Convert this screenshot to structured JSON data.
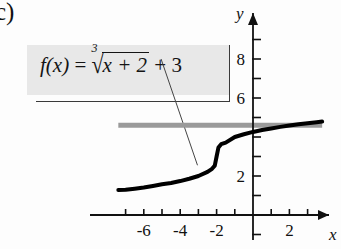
{
  "figure": {
    "part_label": "c)",
    "background_color": "#fdfdfd"
  },
  "callout": {
    "name": "function-formula-callout",
    "fill_color": "#e8e8e8",
    "border_color": "#3a3a3a",
    "formula_plain": "f(x) = cbrt(x + 2) + 3",
    "formula_parts": {
      "lhs": "f(x)",
      "equals": "=",
      "radical_index": "3",
      "radical_sign": "√",
      "radicand": "x + 2",
      "plus": "+",
      "constant": "3"
    }
  },
  "axes": {
    "x_label": "x",
    "y_label": "y",
    "x_tick_labels": [
      "-6",
      "-4",
      "-2",
      "2"
    ],
    "y_tick_labels": [
      "8",
      "6",
      "2"
    ],
    "x_range": [
      -7.6,
      3.8
    ],
    "y_range": [
      -1.0,
      9.8
    ],
    "axis_color": "#111111"
  },
  "chart_data": {
    "type": "line",
    "title": "",
    "xlabel": "x",
    "ylabel": "y",
    "xlim": [
      -7.6,
      3.8
    ],
    "ylim": [
      -1.0,
      9.8
    ],
    "grid": false,
    "legend": "none",
    "x_ticks": [
      -7,
      -6,
      -5,
      -4,
      -3,
      -2,
      -1,
      1,
      2,
      3
    ],
    "x_tick_labels_shown": {
      "-6": "-6",
      "-4": "-4",
      "-2": "-2",
      "2": "2"
    },
    "y_ticks": [
      1,
      2,
      3,
      4,
      5,
      6,
      7,
      8,
      9
    ],
    "y_tick_labels_shown": {
      "8": "8",
      "6": "6",
      "2": "2"
    },
    "series": [
      {
        "name": "f(x) = cbrt(x + 2) + 3",
        "color": "#000000",
        "linewidth": 4,
        "x": [
          -7.4,
          -7.0,
          -6.5,
          -6.0,
          -5.5,
          -5.0,
          -4.5,
          -4.0,
          -3.5,
          -3.0,
          -2.5,
          -2.25,
          -2.1,
          -2.0,
          -1.9,
          -1.75,
          -1.5,
          -1.0,
          -0.5,
          0.0,
          0.5,
          1.0,
          1.5,
          2.0,
          2.5,
          3.0,
          3.5,
          3.8
        ],
        "y": [
          1.28,
          1.29,
          1.35,
          1.41,
          1.49,
          1.58,
          1.64,
          1.74,
          1.86,
          2.0,
          2.21,
          2.37,
          2.53,
          3.0,
          3.46,
          3.63,
          3.71,
          4.0,
          4.14,
          4.26,
          4.36,
          4.44,
          4.52,
          4.59,
          4.65,
          4.71,
          4.76,
          4.79
        ]
      },
      {
        "name": "horizontal-reference-line",
        "color": "#9a9a9a",
        "linewidth": 5,
        "x": [
          -7.4,
          3.8
        ],
        "y": [
          4.6,
          4.6
        ]
      }
    ],
    "annotations": [
      {
        "name": "leader-line",
        "from": [
          -5.05,
          8.0
        ],
        "to": [
          -3.05,
          2.55
        ],
        "color": "#444444"
      }
    ]
  }
}
